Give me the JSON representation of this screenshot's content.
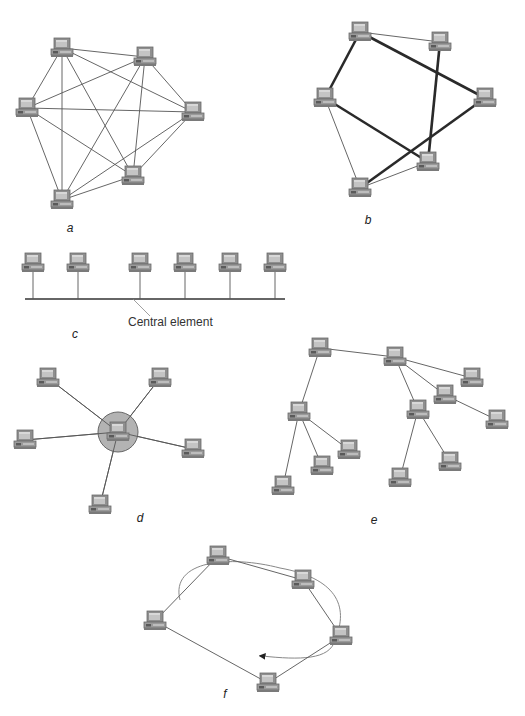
{
  "figure": {
    "panels": [
      {
        "id": "a",
        "label": "a",
        "label_pos": [
          70,
          232
        ],
        "topology": "mesh",
        "nodes": [
          [
            62,
            48
          ],
          [
            145,
            57
          ],
          [
            27,
            108
          ],
          [
            193,
            112
          ],
          [
            133,
            176
          ],
          [
            62,
            200
          ]
        ],
        "edges": [
          [
            0,
            1
          ],
          [
            0,
            3
          ],
          [
            0,
            4
          ],
          [
            0,
            5
          ],
          [
            0,
            2
          ],
          [
            1,
            2
          ],
          [
            1,
            3
          ],
          [
            1,
            4
          ],
          [
            1,
            5
          ],
          [
            2,
            3
          ],
          [
            2,
            4
          ],
          [
            2,
            5
          ],
          [
            3,
            4
          ],
          [
            3,
            5
          ],
          [
            4,
            5
          ]
        ],
        "thick_edges": []
      },
      {
        "id": "b",
        "label": "b",
        "label_pos": [
          368,
          224
        ],
        "topology": "partial-mesh",
        "nodes": [
          [
            360,
            32
          ],
          [
            440,
            42
          ],
          [
            325,
            98
          ],
          [
            485,
            98
          ],
          [
            428,
            162
          ],
          [
            360,
            188
          ]
        ],
        "edges": [
          [
            0,
            1
          ],
          [
            2,
            5
          ],
          [
            4,
            5
          ]
        ],
        "thick_edges": [
          [
            0,
            2
          ],
          [
            0,
            3
          ],
          [
            1,
            4
          ],
          [
            2,
            4
          ],
          [
            3,
            5
          ]
        ]
      },
      {
        "id": "c",
        "label": "c",
        "label_pos": [
          75,
          338
        ],
        "topology": "bus",
        "nodes": [
          [
            33,
            263
          ],
          [
            78,
            263
          ],
          [
            140,
            263
          ],
          [
            185,
            263
          ],
          [
            230,
            263
          ],
          [
            275,
            263
          ]
        ],
        "bus_y": 299,
        "bus_x": [
          25,
          285
        ],
        "annotation": {
          "text": "Central element",
          "pos": [
            128,
            326
          ],
          "leader": [
            [
              133,
              299
            ],
            [
              150,
              316
            ]
          ]
        }
      },
      {
        "id": "d",
        "label": "d",
        "label_pos": [
          140,
          522
        ],
        "topology": "star",
        "hub": [
          118,
          432
        ],
        "hub_radius": 20,
        "hub_color": "#b3b3b3",
        "nodes": [
          [
            48,
            378
          ],
          [
            160,
            378
          ],
          [
            25,
            440
          ],
          [
            193,
            449
          ],
          [
            100,
            505
          ]
        ]
      },
      {
        "id": "e",
        "label": "e",
        "label_pos": [
          374,
          524
        ],
        "topology": "tree",
        "nodes": [
          [
            320,
            348
          ],
          [
            395,
            357
          ],
          [
            472,
            378
          ],
          [
            445,
            395
          ],
          [
            497,
            420
          ],
          [
            299,
            412
          ],
          [
            418,
            410
          ],
          [
            283,
            486
          ],
          [
            322,
            466
          ],
          [
            349,
            450
          ],
          [
            400,
            478
          ],
          [
            450,
            462
          ]
        ],
        "edges": [
          [
            0,
            1
          ],
          [
            0,
            5
          ],
          [
            1,
            2
          ],
          [
            1,
            3
          ],
          [
            1,
            6
          ],
          [
            3,
            4
          ],
          [
            5,
            7
          ],
          [
            5,
            8
          ],
          [
            5,
            9
          ],
          [
            6,
            10
          ],
          [
            6,
            11
          ]
        ],
        "thick_edges": []
      },
      {
        "id": "f",
        "label": "f",
        "label_pos": [
          225,
          698
        ],
        "topology": "ring",
        "nodes": [
          [
            218,
            556
          ],
          [
            303,
            580
          ],
          [
            341,
            636
          ],
          [
            268,
            683
          ],
          [
            155,
            621
          ]
        ],
        "edges": [
          [
            0,
            1
          ],
          [
            1,
            2
          ],
          [
            2,
            3
          ],
          [
            3,
            4
          ],
          [
            4,
            0
          ]
        ],
        "thick_edges": [],
        "direction_arrow": "counter-clockwise"
      }
    ]
  },
  "colors": {
    "line": "#555555",
    "thick_line": "#2a2a2a",
    "computer_body": "#8f8f8f",
    "computer_screen": "#c4c4c4",
    "computer_dark": "#6a6a6a",
    "hub_fill": "#b3b3b3"
  }
}
